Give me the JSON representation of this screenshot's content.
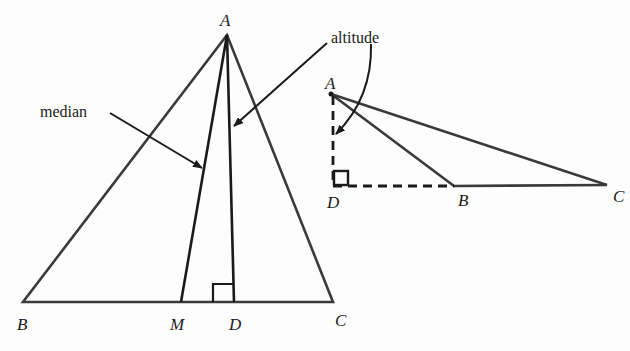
{
  "figure": {
    "left_triangle": {
      "vertices": {
        "A": "A",
        "B": "B",
        "C": "C"
      },
      "points": {
        "M": "M",
        "D": "D"
      },
      "annotations": {
        "median": "median",
        "altitude": "altitude"
      }
    },
    "right_triangle": {
      "vertices": {
        "A": "A",
        "B": "B",
        "C": "C"
      },
      "points": {
        "D": "D"
      }
    },
    "colors": {
      "stroke": "#1a1a1a",
      "side_stroke": "#3a3a3a",
      "background": "#fdfdfd"
    }
  }
}
